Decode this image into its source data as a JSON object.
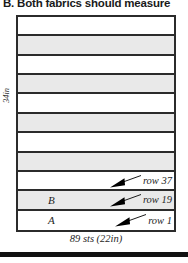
{
  "heading": "B. Both fabrics should measure",
  "diagram": {
    "type": "knitting-fabric-schematic",
    "height_label": "34in",
    "width_label": "89 sts (22in)",
    "stripe_fill_gray": "#e9e9e9",
    "stripe_fill_white": "#ffffff",
    "outline_color": "#2b2b2b",
    "stripes": [
      {
        "fill": "white",
        "letter": "",
        "callout": ""
      },
      {
        "fill": "gray",
        "letter": "",
        "callout": ""
      },
      {
        "fill": "white",
        "letter": "",
        "callout": ""
      },
      {
        "fill": "gray",
        "letter": "",
        "callout": ""
      },
      {
        "fill": "white",
        "letter": "",
        "callout": ""
      },
      {
        "fill": "gray",
        "letter": "",
        "callout": ""
      },
      {
        "fill": "white",
        "letter": "",
        "callout": ""
      },
      {
        "fill": "gray",
        "letter": "",
        "callout": ""
      },
      {
        "fill": "white",
        "letter": "",
        "callout": "row 37"
      },
      {
        "fill": "gray",
        "letter": "B",
        "callout": "row 19"
      },
      {
        "fill": "white",
        "letter": "A",
        "callout": "row 1"
      }
    ]
  }
}
